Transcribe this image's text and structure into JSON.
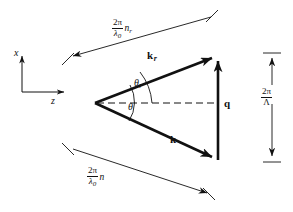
{
  "figure": {
    "kind": "vector-diagram",
    "background_color": "#ffffff",
    "line_color": "#111111",
    "axes": {
      "vertical_label": "x",
      "horizontal_label": "z",
      "origin": {
        "x": 22,
        "y": 92
      },
      "vertical_tip": {
        "x": 22,
        "y": 52
      },
      "horizontal_tip": {
        "x": 68,
        "y": 92
      }
    },
    "vectors": [
      {
        "name": "k_r",
        "label_base": "k",
        "label_sub": "r",
        "from": {
          "x": 95,
          "y": 103
        },
        "to": {
          "x": 218,
          "y": 55
        },
        "label_pos": {
          "x": 147,
          "y": 56
        }
      },
      {
        "name": "k",
        "label_base": "k",
        "label_sub": "",
        "from": {
          "x": 95,
          "y": 103
        },
        "to": {
          "x": 218,
          "y": 160
        },
        "label_pos": {
          "x": 170,
          "y": 139
        }
      },
      {
        "name": "q",
        "label_base": "q",
        "label_sub": "",
        "from": {
          "x": 218,
          "y": 160
        },
        "to": {
          "x": 218,
          "y": 55
        },
        "label_pos": {
          "x": 224,
          "y": 103
        }
      }
    ],
    "angles": [
      {
        "name": "theta_r",
        "symbol": "θ",
        "subscript": "r",
        "label_pos": {
          "x": 137,
          "y": 84
        }
      },
      {
        "name": "theta",
        "symbol": "θ",
        "subscript": "",
        "label_pos": {
          "x": 129,
          "y": 107
        }
      }
    ],
    "dimensions": [
      {
        "name": "k_r-magnitude",
        "numerator": "2π",
        "denominator_base": "λ",
        "denominator_sub": "0",
        "trailing_base": "n",
        "trailing_sub": "r",
        "label_pos": {
          "x": 118,
          "y": 22
        },
        "from": {
          "x": 68,
          "y": 58
        },
        "to": {
          "x": 216,
          "y": 16
        }
      },
      {
        "name": "k-magnitude",
        "numerator": "2π",
        "denominator_base": "λ",
        "denominator_sub": "0",
        "trailing_base": "n",
        "trailing_sub": "",
        "label_pos": {
          "x": 93,
          "y": 171
        },
        "from": {
          "x": 68,
          "y": 148
        },
        "to": {
          "x": 212,
          "y": 196
        }
      },
      {
        "name": "q-magnitude",
        "numerator": "2π",
        "denominator_base": "Λ",
        "denominator_sub": "",
        "trailing_base": "",
        "trailing_sub": "",
        "label_pos": {
          "x": 266,
          "y": 93
        },
        "from": {
          "x": 272,
          "y": 53
        },
        "to": {
          "x": 272,
          "y": 162
        }
      }
    ]
  }
}
